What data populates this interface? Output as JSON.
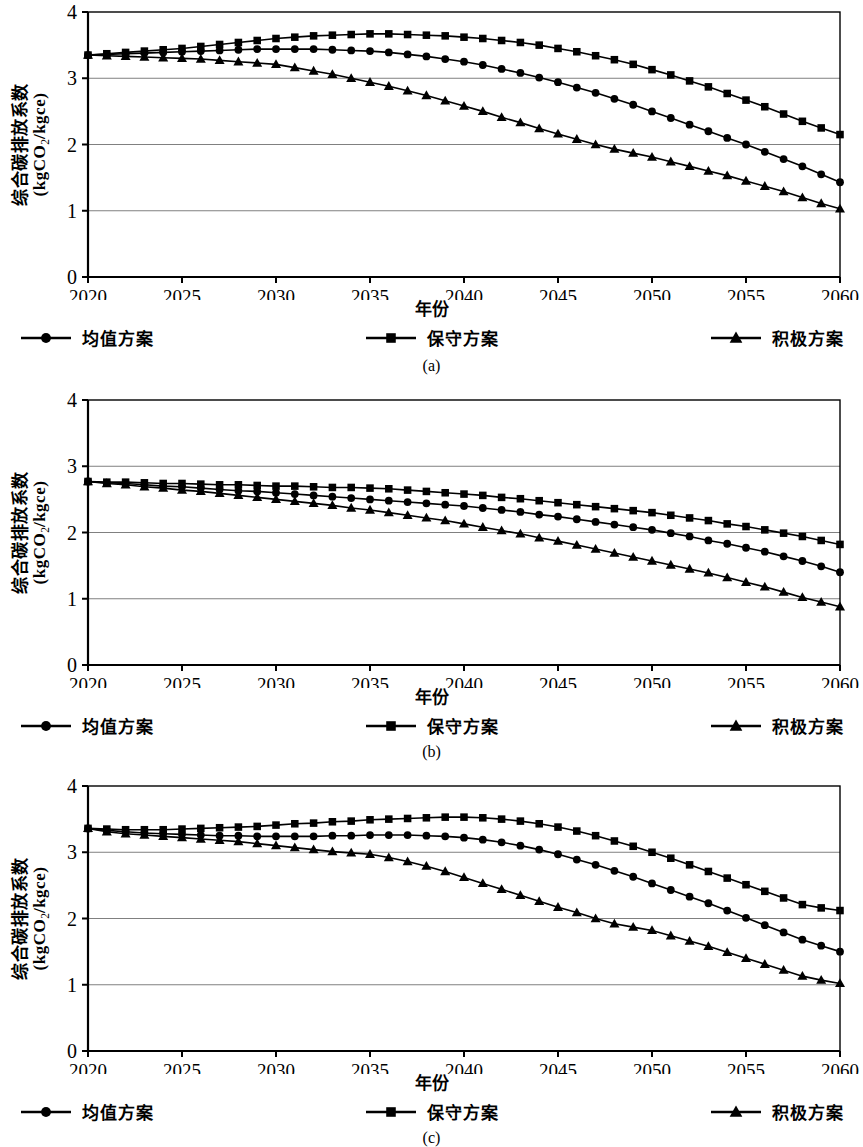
{
  "figure": {
    "axis_labels": {
      "y_main": "综合碳排放系数",
      "y_unit_pre": "(kgCO",
      "y_unit_sub": "2",
      "y_unit_post": "/kgce)",
      "x_title": "年份"
    },
    "legend": [
      {
        "key": "mean",
        "label": "均值方案",
        "marker": "circle"
      },
      {
        "key": "conservative",
        "label": "保守方案",
        "marker": "square"
      },
      {
        "key": "aggressive",
        "label": "积极方案",
        "marker": "triangle"
      }
    ],
    "colors": {
      "ink": "#000000",
      "grid": "#808080",
      "axis": "#000000"
    },
    "panels": [
      {
        "caption": "(a)"
      },
      {
        "caption": "(b)"
      },
      {
        "caption": "(c)"
      }
    ]
  },
  "chart_data": [
    {
      "type": "line",
      "title": "",
      "caption": "(a)",
      "xlabel": "年份",
      "ylabel": "综合碳排放系数 (kgCO2/kgce)",
      "xlim": [
        2020,
        2060
      ],
      "ylim": [
        0,
        4
      ],
      "xticks": [
        2020,
        2025,
        2030,
        2035,
        2040,
        2045,
        2050,
        2055,
        2060
      ],
      "yticks": [
        0,
        1,
        2,
        3,
        4
      ],
      "grid": "horizontal",
      "legend_position": "bottom",
      "x": [
        2020,
        2021,
        2022,
        2023,
        2024,
        2025,
        2026,
        2027,
        2028,
        2029,
        2030,
        2031,
        2032,
        2033,
        2034,
        2035,
        2036,
        2037,
        2038,
        2039,
        2040,
        2041,
        2042,
        2043,
        2044,
        2045,
        2046,
        2047,
        2048,
        2049,
        2050,
        2051,
        2052,
        2053,
        2054,
        2055,
        2056,
        2057,
        2058,
        2059,
        2060
      ],
      "series": [
        {
          "name": "均值方案",
          "marker": "circle",
          "values": [
            3.35,
            3.36,
            3.37,
            3.38,
            3.39,
            3.4,
            3.41,
            3.42,
            3.43,
            3.44,
            3.44,
            3.44,
            3.44,
            3.43,
            3.42,
            3.41,
            3.39,
            3.36,
            3.33,
            3.29,
            3.25,
            3.2,
            3.14,
            3.08,
            3.01,
            2.94,
            2.86,
            2.78,
            2.69,
            2.6,
            2.5,
            2.4,
            2.3,
            2.2,
            2.1,
            2.0,
            1.89,
            1.78,
            1.67,
            1.55,
            1.43
          ]
        },
        {
          "name": "保守方案",
          "marker": "square",
          "values": [
            3.35,
            3.37,
            3.39,
            3.41,
            3.43,
            3.45,
            3.48,
            3.51,
            3.54,
            3.57,
            3.6,
            3.62,
            3.64,
            3.65,
            3.66,
            3.67,
            3.67,
            3.66,
            3.65,
            3.64,
            3.62,
            3.6,
            3.57,
            3.54,
            3.5,
            3.45,
            3.4,
            3.34,
            3.28,
            3.21,
            3.13,
            3.05,
            2.96,
            2.87,
            2.77,
            2.67,
            2.57,
            2.46,
            2.35,
            2.25,
            2.15
          ]
        },
        {
          "name": "积极方案",
          "marker": "triangle",
          "values": [
            3.35,
            3.34,
            3.33,
            3.32,
            3.31,
            3.3,
            3.29,
            3.27,
            3.25,
            3.23,
            3.21,
            3.16,
            3.11,
            3.06,
            3.0,
            2.94,
            2.88,
            2.81,
            2.74,
            2.66,
            2.58,
            2.5,
            2.41,
            2.33,
            2.24,
            2.16,
            2.08,
            2.0,
            1.93,
            1.87,
            1.81,
            1.74,
            1.67,
            1.6,
            1.53,
            1.45,
            1.37,
            1.29,
            1.2,
            1.11,
            1.03
          ]
        }
      ]
    },
    {
      "type": "line",
      "title": "",
      "caption": "(b)",
      "xlabel": "年份",
      "ylabel": "综合碳排放系数 (kgCO2/kgce)",
      "xlim": [
        2020,
        2060
      ],
      "ylim": [
        0,
        4
      ],
      "xticks": [
        2020,
        2025,
        2030,
        2035,
        2040,
        2045,
        2050,
        2055,
        2060
      ],
      "yticks": [
        0,
        1,
        2,
        3,
        4
      ],
      "grid": "horizontal",
      "legend_position": "bottom",
      "x": [
        2020,
        2021,
        2022,
        2023,
        2024,
        2025,
        2026,
        2027,
        2028,
        2029,
        2030,
        2031,
        2032,
        2033,
        2034,
        2035,
        2036,
        2037,
        2038,
        2039,
        2040,
        2041,
        2042,
        2043,
        2044,
        2045,
        2046,
        2047,
        2048,
        2049,
        2050,
        2051,
        2052,
        2053,
        2054,
        2055,
        2056,
        2057,
        2058,
        2059,
        2060
      ],
      "series": [
        {
          "name": "均值方案",
          "marker": "circle",
          "values": [
            2.77,
            2.75,
            2.74,
            2.72,
            2.7,
            2.69,
            2.67,
            2.65,
            2.63,
            2.62,
            2.6,
            2.58,
            2.56,
            2.54,
            2.52,
            2.5,
            2.48,
            2.46,
            2.44,
            2.42,
            2.4,
            2.37,
            2.34,
            2.31,
            2.27,
            2.24,
            2.2,
            2.16,
            2.12,
            2.08,
            2.04,
            1.99,
            1.94,
            1.88,
            1.83,
            1.77,
            1.71,
            1.64,
            1.57,
            1.49,
            1.4
          ]
        },
        {
          "name": "保守方案",
          "marker": "square",
          "values": [
            2.77,
            2.76,
            2.76,
            2.75,
            2.74,
            2.74,
            2.73,
            2.72,
            2.72,
            2.71,
            2.7,
            2.7,
            2.69,
            2.68,
            2.68,
            2.67,
            2.66,
            2.64,
            2.62,
            2.6,
            2.58,
            2.56,
            2.53,
            2.51,
            2.48,
            2.45,
            2.42,
            2.39,
            2.36,
            2.33,
            2.3,
            2.26,
            2.22,
            2.18,
            2.13,
            2.09,
            2.04,
            1.99,
            1.94,
            1.88,
            1.82
          ]
        },
        {
          "name": "积极方案",
          "marker": "triangle",
          "values": [
            2.77,
            2.74,
            2.72,
            2.69,
            2.67,
            2.64,
            2.62,
            2.59,
            2.56,
            2.53,
            2.5,
            2.47,
            2.44,
            2.41,
            2.37,
            2.34,
            2.3,
            2.26,
            2.22,
            2.18,
            2.13,
            2.08,
            2.03,
            1.98,
            1.92,
            1.87,
            1.81,
            1.75,
            1.69,
            1.63,
            1.57,
            1.51,
            1.45,
            1.39,
            1.32,
            1.25,
            1.18,
            1.1,
            1.02,
            0.95,
            0.88
          ]
        }
      ]
    },
    {
      "type": "line",
      "title": "",
      "caption": "(c)",
      "xlabel": "年份",
      "ylabel": "综合碳排放系数 (kgCO2/kgce)",
      "xlim": [
        2020,
        2060
      ],
      "ylim": [
        0,
        4
      ],
      "xticks": [
        2020,
        2025,
        2030,
        2035,
        2040,
        2045,
        2050,
        2055,
        2060
      ],
      "yticks": [
        0,
        1,
        2,
        3,
        4
      ],
      "grid": "horizontal",
      "legend_position": "bottom",
      "x": [
        2020,
        2021,
        2022,
        2023,
        2024,
        2025,
        2026,
        2027,
        2028,
        2029,
        2030,
        2031,
        2032,
        2033,
        2034,
        2035,
        2036,
        2037,
        2038,
        2039,
        2040,
        2041,
        2042,
        2043,
        2044,
        2045,
        2046,
        2047,
        2048,
        2049,
        2050,
        2051,
        2052,
        2053,
        2054,
        2055,
        2056,
        2057,
        2058,
        2059,
        2060
      ],
      "series": [
        {
          "name": "均值方案",
          "marker": "circle",
          "values": [
            3.36,
            3.33,
            3.31,
            3.29,
            3.28,
            3.27,
            3.26,
            3.25,
            3.25,
            3.24,
            3.24,
            3.24,
            3.24,
            3.25,
            3.25,
            3.26,
            3.26,
            3.26,
            3.25,
            3.24,
            3.22,
            3.19,
            3.15,
            3.1,
            3.04,
            2.97,
            2.89,
            2.81,
            2.72,
            2.63,
            2.53,
            2.43,
            2.33,
            2.23,
            2.12,
            2.01,
            1.9,
            1.79,
            1.68,
            1.59,
            1.5
          ]
        },
        {
          "name": "保守方案",
          "marker": "square",
          "values": [
            3.36,
            3.35,
            3.34,
            3.34,
            3.34,
            3.35,
            3.36,
            3.37,
            3.38,
            3.39,
            3.41,
            3.43,
            3.44,
            3.46,
            3.47,
            3.49,
            3.5,
            3.51,
            3.52,
            3.53,
            3.53,
            3.52,
            3.5,
            3.47,
            3.43,
            3.38,
            3.32,
            3.25,
            3.17,
            3.09,
            3.0,
            2.91,
            2.81,
            2.71,
            2.61,
            2.51,
            2.41,
            2.31,
            2.21,
            2.16,
            2.12
          ]
        },
        {
          "name": "积极方案",
          "marker": "triangle",
          "values": [
            3.36,
            3.31,
            3.28,
            3.26,
            3.24,
            3.22,
            3.2,
            3.18,
            3.16,
            3.13,
            3.1,
            3.07,
            3.04,
            3.01,
            2.99,
            2.97,
            2.92,
            2.86,
            2.79,
            2.71,
            2.62,
            2.53,
            2.44,
            2.35,
            2.26,
            2.17,
            2.09,
            2.0,
            1.92,
            1.87,
            1.82,
            1.74,
            1.66,
            1.58,
            1.49,
            1.4,
            1.31,
            1.22,
            1.13,
            1.07,
            1.02
          ]
        }
      ]
    }
  ]
}
